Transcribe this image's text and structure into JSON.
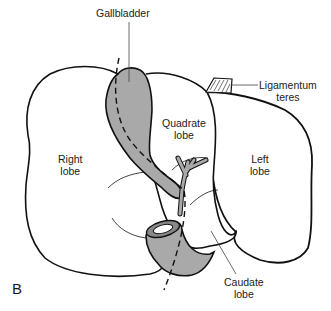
{
  "figure": {
    "panel_letter": "B",
    "colors": {
      "outline": "#111111",
      "shaded_structure": "#a9a9a9",
      "background": "#ffffff",
      "leader_line": "#444444"
    }
  },
  "labels": {
    "gallbladder": {
      "line1": "Gallbladder"
    },
    "ligamentum_teres": {
      "line1": "Ligamentum",
      "line2": "teres"
    },
    "quadrate_lobe": {
      "line1": "Quadrate",
      "line2": "lobe"
    },
    "right_lobe": {
      "line1": "Right",
      "line2": "lobe"
    },
    "left_lobe": {
      "line1": "Left",
      "line2": "lobe"
    },
    "caudate_lobe": {
      "line1": "Caudate",
      "line2": "lobe"
    }
  }
}
